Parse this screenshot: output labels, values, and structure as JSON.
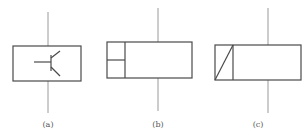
{
  "figures": [
    {
      "id": "a",
      "label": "(a)",
      "symbol": "transistor-in-box"
    },
    {
      "id": "b",
      "label": "(b)",
      "symbol": "box-with-split-left-cell"
    },
    {
      "id": "c",
      "label": "(c)",
      "symbol": "box-with-diagonal-left-cell"
    }
  ],
  "colors": {
    "line": "#4a4a4a",
    "lead": "#9a9a9a",
    "label": "#555555"
  }
}
